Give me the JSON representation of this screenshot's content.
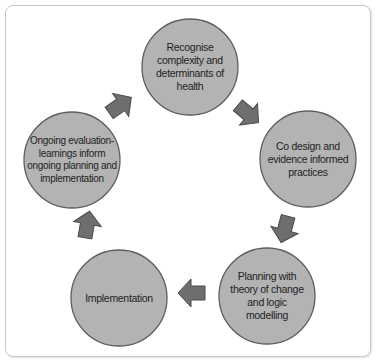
{
  "diagram": {
    "type": "cycle",
    "colors": {
      "node_fill": "#b3b3b3",
      "node_stroke": "#5e5e5e",
      "arrow_fill": "#6e6e6e",
      "arrow_stroke": "#4a4a4a",
      "text": "#1e1e1e",
      "frame_border": "#c8c8c8"
    },
    "nodes": [
      {
        "id": "recognise",
        "label": "Recognise complexity and determinants of health"
      },
      {
        "id": "codesign",
        "label": "Co design and evidence informed practices"
      },
      {
        "id": "planning",
        "label": "Planning with theory of change and logic modelling"
      },
      {
        "id": "implementation",
        "label": "Implementation"
      },
      {
        "id": "evaluation",
        "label": "Ongoing evaluation-learnings inform ongoing planning and implementation"
      }
    ],
    "edges": [
      {
        "from": "recognise",
        "to": "codesign"
      },
      {
        "from": "codesign",
        "to": "planning"
      },
      {
        "from": "planning",
        "to": "implementation"
      },
      {
        "from": "implementation",
        "to": "evaluation"
      },
      {
        "from": "evaluation",
        "to": "recognise"
      }
    ]
  }
}
